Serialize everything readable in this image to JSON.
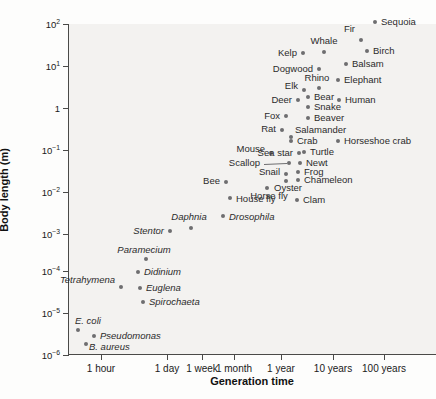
{
  "chart_data": {
    "type": "scatter",
    "title": "",
    "xlabel": "Generation time",
    "ylabel": "Body length (m)",
    "grid": false,
    "legend": "none",
    "xticklabels": [
      "1 hour",
      "1 day",
      "1 week",
      "1 month",
      "1 year",
      "10 years",
      "100 years"
    ],
    "xtickpos": [
      100,
      166,
      201,
      233,
      280,
      332,
      383
    ],
    "yticklabels": [
      "10",
      "10",
      "1",
      "10",
      "10",
      "10",
      "10",
      "10",
      "10"
    ],
    "yticks": [
      {
        "mantissa": "10",
        "exp": "2",
        "y": 24
      },
      {
        "mantissa": "10",
        "exp": "1",
        "y": 66
      },
      {
        "mantissa": "1",
        "exp": "",
        "y": 108
      },
      {
        "mantissa": "10",
        "exp": "−1",
        "y": 150
      },
      {
        "mantissa": "10",
        "exp": "−2",
        "y": 192
      },
      {
        "mantissa": "10",
        "exp": "−3",
        "y": 234
      },
      {
        "mantissa": "10",
        "exp": "−4",
        "y": 271
      },
      {
        "mantissa": "10",
        "exp": "−5",
        "y": 313
      },
      {
        "mantissa": "10",
        "exp": "−6",
        "y": 355
      }
    ],
    "points": [
      {
        "name": "Sequoia",
        "px": 374,
        "py": 22,
        "lx": 380,
        "ly": 22,
        "anchor": "lf",
        "italic": false
      },
      {
        "name": "Fir",
        "px": 360,
        "py": 40,
        "lx": 354,
        "ly": 29,
        "anchor": "rt",
        "italic": false
      },
      {
        "name": "Birch",
        "px": 366,
        "py": 51,
        "lx": 372,
        "ly": 51,
        "anchor": "lf",
        "italic": false
      },
      {
        "name": "Whale",
        "px": 323,
        "py": 52,
        "lx": 323,
        "ly": 41,
        "anchor": "ct",
        "italic": false
      },
      {
        "name": "Kelp",
        "px": 302,
        "py": 53,
        "lx": 296,
        "ly": 53,
        "anchor": "rt",
        "italic": false
      },
      {
        "name": "Balsam",
        "px": 345,
        "py": 64,
        "lx": 351,
        "ly": 64,
        "anchor": "lf",
        "italic": false
      },
      {
        "name": "Dogwood",
        "px": 318,
        "py": 69,
        "lx": 312,
        "ly": 69,
        "anchor": "rt",
        "italic": false
      },
      {
        "name": "Rhino",
        "px": 318,
        "py": 88,
        "lx": 316,
        "ly": 78,
        "anchor": "ct",
        "italic": false
      },
      {
        "name": "Elephant",
        "px": 337,
        "py": 80,
        "lx": 343,
        "ly": 80,
        "anchor": "lf",
        "italic": false
      },
      {
        "name": "Elk",
        "px": 303,
        "py": 90,
        "lx": 297,
        "ly": 86,
        "anchor": "rt",
        "italic": false
      },
      {
        "name": "Bear",
        "px": 307,
        "py": 97,
        "lx": 313,
        "ly": 97,
        "anchor": "lf",
        "italic": false
      },
      {
        "name": "Deer",
        "px": 297,
        "py": 100,
        "lx": 291,
        "ly": 100,
        "anchor": "rt",
        "italic": false
      },
      {
        "name": "Human",
        "px": 338,
        "py": 100,
        "lx": 344,
        "ly": 100,
        "anchor": "lf",
        "italic": false
      },
      {
        "name": "Snake",
        "px": 307,
        "py": 107,
        "lx": 313,
        "ly": 107,
        "anchor": "lf",
        "italic": false
      },
      {
        "name": "Beaver",
        "px": 307,
        "py": 118,
        "lx": 313,
        "ly": 118,
        "anchor": "lf",
        "italic": false
      },
      {
        "name": "Fox",
        "px": 285,
        "py": 116,
        "lx": 279,
        "ly": 116,
        "anchor": "rt",
        "italic": false
      },
      {
        "name": "Rat",
        "px": 281,
        "py": 130,
        "lx": 275,
        "ly": 129,
        "anchor": "rt",
        "italic": false
      },
      {
        "name": "Salamander",
        "px": 290,
        "py": 137,
        "lx": 294,
        "ly": 130,
        "anchor": "lf",
        "italic": false
      },
      {
        "name": "Crab",
        "px": 290,
        "py": 141,
        "lx": 296,
        "ly": 141,
        "anchor": "lf",
        "italic": false
      },
      {
        "name": "Horseshoe crab",
        "px": 337,
        "py": 141,
        "lx": 343,
        "ly": 141,
        "anchor": "lf",
        "italic": false
      },
      {
        "name": "Mouse",
        "px": 270,
        "py": 153,
        "lx": 264,
        "ly": 149,
        "anchor": "rt",
        "italic": false
      },
      {
        "name": "Sea star",
        "px": 298,
        "py": 153,
        "lx": 292,
        "ly": 153,
        "anchor": "rt",
        "italic": false
      },
      {
        "name": "Turtle",
        "px": 303,
        "py": 152,
        "lx": 309,
        "ly": 152,
        "anchor": "lf",
        "italic": false
      },
      {
        "name": "Newt",
        "px": 299,
        "py": 163,
        "lx": 305,
        "ly": 163,
        "anchor": "lf",
        "italic": false
      },
      {
        "name": "Scallop",
        "px": 288,
        "py": 163,
        "lx": 259,
        "ly": 163,
        "anchor": "rt",
        "italic": false
      },
      {
        "name": "Frog",
        "px": 297,
        "py": 172,
        "lx": 303,
        "ly": 172,
        "anchor": "lf",
        "italic": false
      },
      {
        "name": "Snail",
        "px": 285,
        "py": 174,
        "lx": 279,
        "ly": 172,
        "anchor": "rt",
        "italic": false
      },
      {
        "name": "Chameleon",
        "px": 297,
        "py": 180,
        "lx": 303,
        "ly": 180,
        "anchor": "lf",
        "italic": false
      },
      {
        "name": "Oyster",
        "px": 285,
        "py": 181,
        "lx": 287,
        "ly": 188,
        "anchor": "ct",
        "italic": false
      },
      {
        "name": "Bee",
        "px": 225,
        "py": 182,
        "lx": 219,
        "ly": 181,
        "anchor": "rt",
        "italic": false
      },
      {
        "name": "Horse fly",
        "px": 266,
        "py": 188,
        "lx": 268,
        "ly": 196,
        "anchor": "ct",
        "italic": false
      },
      {
        "name": "House fly",
        "px": 229,
        "py": 198,
        "lx": 235,
        "ly": 199,
        "anchor": "lf",
        "italic": false
      },
      {
        "name": "Clam",
        "px": 296,
        "py": 200,
        "lx": 302,
        "ly": 200,
        "anchor": "lf",
        "italic": false
      },
      {
        "name": "Drosophila",
        "px": 222,
        "py": 216,
        "lx": 228,
        "ly": 217,
        "anchor": "lf",
        "italic": true
      },
      {
        "name": "Daphnia",
        "px": 190,
        "py": 228,
        "lx": 188,
        "ly": 217,
        "anchor": "ct",
        "italic": true
      },
      {
        "name": "Stentor",
        "px": 169,
        "py": 231,
        "lx": 163,
        "ly": 231,
        "anchor": "rt",
        "italic": true
      },
      {
        "name": "Paramecium",
        "px": 145,
        "py": 259,
        "lx": 143,
        "ly": 250,
        "anchor": "ct",
        "italic": true
      },
      {
        "name": "Didinium",
        "px": 137,
        "py": 272,
        "lx": 143,
        "ly": 272,
        "anchor": "lf",
        "italic": true
      },
      {
        "name": "Tetrahymena",
        "px": 120,
        "py": 287,
        "lx": 114,
        "ly": 280,
        "anchor": "rt",
        "italic": true
      },
      {
        "name": "Euglena",
        "px": 139,
        "py": 288,
        "lx": 145,
        "ly": 288,
        "anchor": "lf",
        "italic": true
      },
      {
        "name": "Spirochaeta",
        "px": 142,
        "py": 302,
        "lx": 148,
        "ly": 302,
        "anchor": "lf",
        "italic": true
      },
      {
        "name": "E. coli",
        "px": 77,
        "py": 330,
        "lx": 74,
        "ly": 321,
        "anchor": "lf",
        "italic": true
      },
      {
        "name": "Pseudomonas",
        "px": 93,
        "py": 336,
        "lx": 99,
        "ly": 336,
        "anchor": "lf",
        "italic": true
      },
      {
        "name": "B. aureus",
        "px": 85,
        "py": 344,
        "lx": 88,
        "ly": 347,
        "anchor": "lf",
        "italic": true
      }
    ],
    "leaders": [
      {
        "x1": 263,
        "y1": 164,
        "x2": 286,
        "y2": 163
      }
    ]
  }
}
